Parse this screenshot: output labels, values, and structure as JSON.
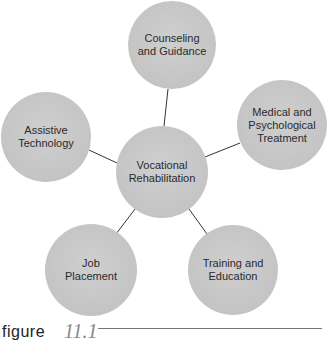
{
  "diagram": {
    "type": "hub-and-spoke",
    "center": {
      "label": "Vocational\nRehabilitation",
      "cx": 162,
      "cy": 172,
      "r": 46
    },
    "nodes": [
      {
        "id": "counseling",
        "label": "Counseling\nand Guidance",
        "cx": 172,
        "cy": 45,
        "r": 44
      },
      {
        "id": "medical",
        "label": "Medical and\nPsychological\nTreatment",
        "cx": 282,
        "cy": 125,
        "r": 45
      },
      {
        "id": "training",
        "label": "Training and\nEducation",
        "cx": 233,
        "cy": 270,
        "r": 45
      },
      {
        "id": "job",
        "label": "Job\nPlacement",
        "cx": 91,
        "cy": 270,
        "r": 46
      },
      {
        "id": "assistive",
        "label": "Assistive\nTechnology",
        "cx": 46,
        "cy": 137,
        "r": 45
      }
    ],
    "edge_color": "#333333",
    "node_fill": "#c6c6c7",
    "text_color": "#2a2a2a"
  },
  "caption": {
    "word": "figure",
    "number": "11.1"
  }
}
